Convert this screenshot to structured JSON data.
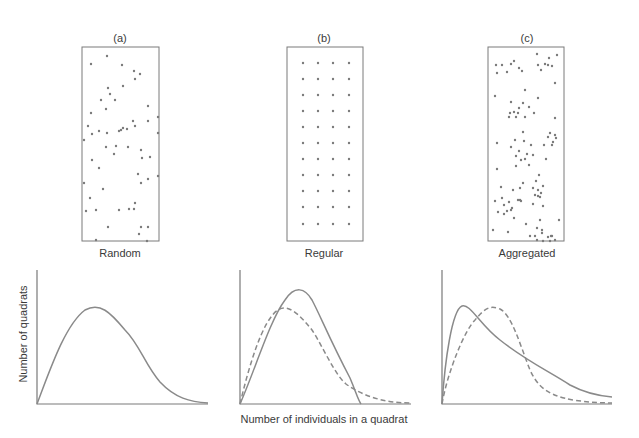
{
  "figure": {
    "stroke_color": "#7a7a7a",
    "curve_color": "#8a8a8a",
    "dot_color": "#7a7a7a",
    "y_axis_label": "Number of quadrats",
    "x_axis_label": "Number of individuals in a quadrat"
  },
  "panels": [
    {
      "letter": "(a)",
      "label": "Random",
      "box": {
        "x": 82,
        "y": 47,
        "w": 77,
        "h": 194
      },
      "dots": [
        [
          107,
          56
        ],
        [
          91,
          64
        ],
        [
          122,
          65
        ],
        [
          134,
          71
        ],
        [
          140,
          74
        ],
        [
          135,
          79
        ],
        [
          108,
          88
        ],
        [
          110,
          94
        ],
        [
          123,
          86
        ],
        [
          101,
          100
        ],
        [
          106,
          109
        ],
        [
          115,
          100
        ],
        [
          91,
          113
        ],
        [
          148,
          106
        ],
        [
          88,
          126
        ],
        [
          92,
          134
        ],
        [
          99,
          131
        ],
        [
          107,
          133
        ],
        [
          119,
          131
        ],
        [
          121,
          130
        ],
        [
          123,
          128
        ],
        [
          127,
          129
        ],
        [
          133,
          121
        ],
        [
          135,
          126
        ],
        [
          148,
          121
        ],
        [
          158,
          117
        ],
        [
          84,
          140
        ],
        [
          158,
          133
        ],
        [
          106,
          147
        ],
        [
          114,
          154
        ],
        [
          116,
          146
        ],
        [
          128,
          147
        ],
        [
          141,
          150
        ],
        [
          142,
          158
        ],
        [
          150,
          157
        ],
        [
          92,
          160
        ],
        [
          99,
          168
        ],
        [
          138,
          174
        ],
        [
          141,
          183
        ],
        [
          148,
          179
        ],
        [
          84,
          183
        ],
        [
          158,
          176
        ],
        [
          103,
          189
        ],
        [
          90,
          198
        ],
        [
          96,
          210
        ],
        [
          86,
          211
        ],
        [
          129,
          209
        ],
        [
          135,
          203
        ],
        [
          134,
          209
        ],
        [
          119,
          210
        ],
        [
          108,
          227
        ],
        [
          141,
          227
        ],
        [
          148,
          227
        ],
        [
          139,
          234
        ],
        [
          147,
          241
        ],
        [
          96,
          240
        ]
      ]
    },
    {
      "letter": "(b)",
      "label": "Regular",
      "box": {
        "x": 287,
        "y": 47,
        "w": 76,
        "h": 194
      },
      "grid": {
        "cols": [
          303,
          318,
          333,
          349
        ],
        "rows": [
          63,
          79,
          95,
          111,
          127,
          143,
          159,
          175,
          191,
          207,
          224
        ]
      }
    },
    {
      "letter": "(c)",
      "label": "Aggregated",
      "box": {
        "x": 488,
        "y": 47,
        "w": 76,
        "h": 194
      },
      "dots": [
        [
          537,
          54
        ],
        [
          557,
          55
        ],
        [
          549,
          58
        ],
        [
          514,
          61
        ],
        [
          496,
          65
        ],
        [
          502,
          65
        ],
        [
          511,
          64
        ],
        [
          519,
          68
        ],
        [
          497,
          73
        ],
        [
          507,
          72
        ],
        [
          522,
          71
        ],
        [
          538,
          65
        ],
        [
          545,
          64
        ],
        [
          548,
          65
        ],
        [
          541,
          70
        ],
        [
          552,
          66
        ],
        [
          555,
          83
        ],
        [
          525,
          90
        ],
        [
          495,
          96
        ],
        [
          538,
          98
        ],
        [
          511,
          102
        ],
        [
          523,
          103
        ],
        [
          519,
          108
        ],
        [
          514,
          112
        ],
        [
          529,
          107
        ],
        [
          518,
          113
        ],
        [
          510,
          113
        ],
        [
          509,
          117
        ],
        [
          516,
          117
        ],
        [
          525,
          117
        ],
        [
          534,
          113
        ],
        [
          555,
          118
        ],
        [
          523,
          132
        ],
        [
          550,
          133
        ],
        [
          555,
          135
        ],
        [
          548,
          137
        ],
        [
          556,
          138
        ],
        [
          553,
          142
        ],
        [
          552,
          145
        ],
        [
          544,
          145
        ],
        [
          515,
          140
        ],
        [
          524,
          141
        ],
        [
          531,
          145
        ],
        [
          497,
          143
        ],
        [
          511,
          147
        ],
        [
          519,
          151
        ],
        [
          527,
          154
        ],
        [
          516,
          156
        ],
        [
          525,
          159
        ],
        [
          533,
          155
        ],
        [
          521,
          160
        ],
        [
          529,
          165
        ],
        [
          546,
          159
        ],
        [
          516,
          166
        ],
        [
          497,
          169
        ],
        [
          539,
          175
        ],
        [
          536,
          181
        ],
        [
          523,
          183
        ],
        [
          501,
          187
        ],
        [
          520,
          188
        ],
        [
          543,
          186
        ],
        [
          533,
          188
        ],
        [
          538,
          190
        ],
        [
          513,
          190
        ],
        [
          541,
          193
        ],
        [
          535,
          195
        ],
        [
          540,
          197
        ],
        [
          518,
          200
        ],
        [
          538,
          196
        ],
        [
          495,
          201
        ],
        [
          502,
          198
        ],
        [
          509,
          202
        ],
        [
          520,
          200
        ],
        [
          521,
          201
        ],
        [
          504,
          205
        ],
        [
          512,
          208
        ],
        [
          507,
          211
        ],
        [
          533,
          204
        ],
        [
          543,
          206
        ],
        [
          498,
          212
        ],
        [
          504,
          214
        ],
        [
          511,
          210
        ],
        [
          540,
          220
        ],
        [
          526,
          224
        ],
        [
          514,
          218
        ],
        [
          559,
          220
        ],
        [
          537,
          228
        ],
        [
          542,
          230
        ],
        [
          493,
          230
        ],
        [
          508,
          232
        ],
        [
          530,
          236
        ],
        [
          535,
          236
        ],
        [
          542,
          233
        ],
        [
          537,
          240
        ],
        [
          543,
          241
        ],
        [
          548,
          237
        ],
        [
          552,
          236
        ],
        [
          550,
          241
        ],
        [
          551,
          236
        ],
        [
          555,
          240
        ]
      ]
    }
  ],
  "chart_data": [
    {
      "type": "line",
      "title": "Random",
      "xlabel": "Number of individuals in a quadrat",
      "ylabel": "Number of quadrats",
      "axes": {
        "x0": 37,
        "y0": 404,
        "x1": 208,
        "ytop": 270
      },
      "series": [
        {
          "name": "observed",
          "style": "solid",
          "path": "M37,404 C50,370 65,325 85,310 C100,302 110,312 125,330 C140,345 145,365 160,382 C175,398 190,402 208,403"
        }
      ]
    },
    {
      "type": "line",
      "title": "Regular",
      "xlabel": "Number of individuals in a quadrat",
      "ylabel": "Number of quadrats",
      "axes": {
        "x0": 240,
        "y0": 404,
        "x1": 411,
        "ytop": 270
      },
      "series": [
        {
          "name": "observed",
          "style": "solid",
          "path": "M240,404 C255,370 270,320 285,300 C295,285 305,288 312,300 C320,315 330,340 350,378 C356,392 358,400 361,404"
        },
        {
          "name": "expected-random",
          "style": "dashed",
          "path": "M240,404 C248,370 262,320 278,310 C288,303 300,315 312,330 C322,345 335,375 346,384 C360,394 380,403 411,403"
        }
      ]
    },
    {
      "type": "line",
      "title": "Aggregated",
      "xlabel": "Number of individuals in a quadrat",
      "ylabel": "Number of quadrats",
      "axes": {
        "x0": 442,
        "y0": 404,
        "x1": 612,
        "ytop": 270
      },
      "series": [
        {
          "name": "observed",
          "style": "solid",
          "path": "M442,404 C445,360 452,310 462,306 C470,303 480,325 500,340 C525,360 550,372 570,385 C585,393 600,396 612,397"
        },
        {
          "name": "expected-random",
          "style": "dashed",
          "path": "M442,404 C448,370 465,330 475,320 C485,308 490,305 500,309 C512,315 520,345 530,370 C540,392 555,402 612,403"
        }
      ]
    }
  ]
}
